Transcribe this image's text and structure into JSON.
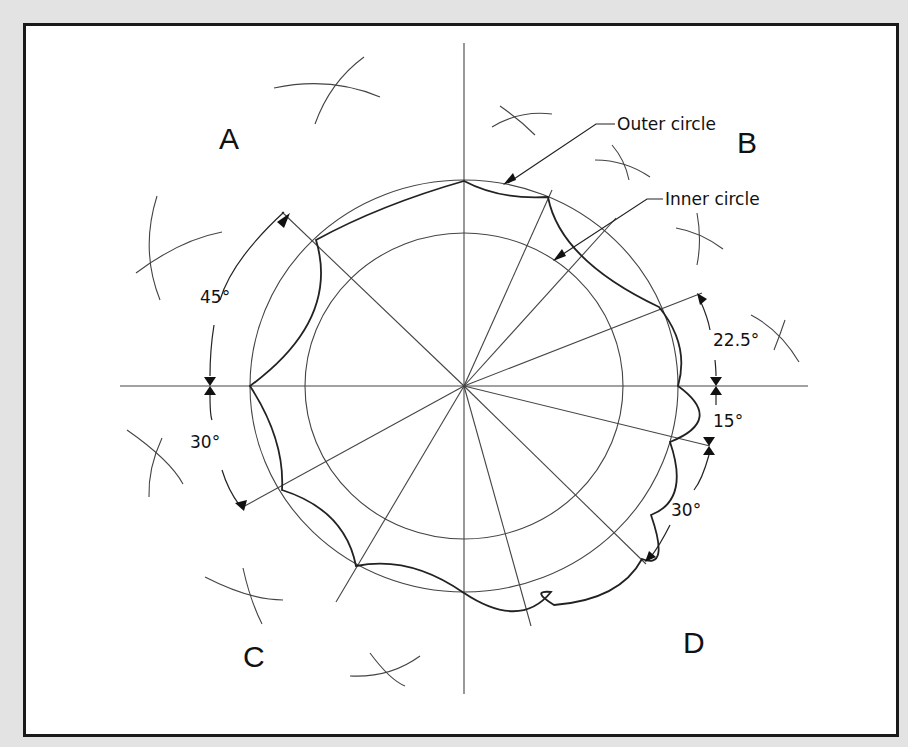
{
  "diagram": {
    "quadrant_labels": {
      "A": "A",
      "B": "B",
      "C": "C",
      "D": "D"
    },
    "callouts": {
      "outer_circle": "Outer circle",
      "inner_circle": "Inner circle"
    },
    "angles": {
      "left_upper": "45°",
      "left_lower": "30°",
      "right_upper": "22.5°",
      "right_middle": "15°",
      "right_lower": "30°"
    },
    "geometry": {
      "center": [
        464,
        386
      ],
      "outer_radius": [
        214,
        206
      ],
      "inner_radius": [
        159,
        153
      ]
    },
    "colors": {
      "background": "#e3e3e3",
      "paper": "#ffffff",
      "ink": "#111111"
    }
  }
}
